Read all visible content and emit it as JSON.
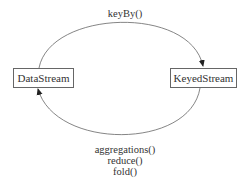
{
  "diagram": {
    "nodes": [
      {
        "id": "datastream",
        "label": "DataStream"
      },
      {
        "id": "keyedstream",
        "label": "KeyedStream"
      }
    ],
    "edges": [
      {
        "from": "datastream",
        "to": "keyedstream",
        "labels": [
          "keyBy()"
        ]
      },
      {
        "from": "keyedstream",
        "to": "datastream",
        "labels": [
          "aggregations()",
          "reduce()",
          "fold()"
        ]
      }
    ],
    "colors": {
      "line": "#555555",
      "border": "#666666",
      "text": "#333333"
    }
  }
}
